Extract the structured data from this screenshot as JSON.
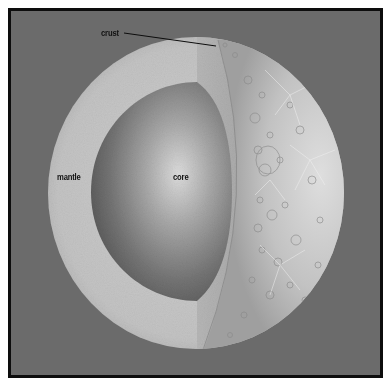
{
  "diagram": {
    "type": "cutaway-sphere",
    "colors": {
      "background": "#6b6b6b",
      "frame_border": "#0d0d0d",
      "mantle": "#c4c4c4",
      "core_highlight": "#d8d8d8",
      "core_shadow": "#5e5e5e",
      "surface": "#bdbdbd",
      "label_text": "#111111"
    },
    "labels": {
      "crust": "crust",
      "mantle": "mantle",
      "core": "core"
    },
    "layers": [
      {
        "name": "crust",
        "description": "thin outer cratered surface layer"
      },
      {
        "name": "mantle",
        "description": "thick middle layer"
      },
      {
        "name": "core",
        "description": "central sphere"
      }
    ]
  }
}
